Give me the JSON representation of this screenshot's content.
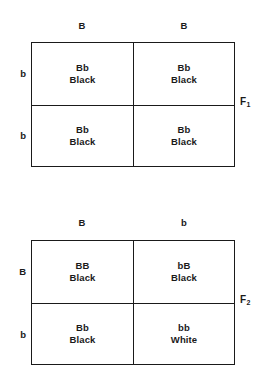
{
  "figure": {
    "ink_color": "#1a1a1a",
    "background_color": "#ffffff"
  },
  "squares": [
    {
      "generation_label": "F",
      "generation_subscript": "1",
      "column_headers": [
        "B",
        "B"
      ],
      "row_headers": [
        "b",
        "b"
      ],
      "cells": [
        {
          "genotype": "Bb",
          "phenotype": "Black"
        },
        {
          "genotype": "Bb",
          "phenotype": "Black"
        },
        {
          "genotype": "Bb",
          "phenotype": "Black"
        },
        {
          "genotype": "Bb",
          "phenotype": "Black"
        }
      ]
    },
    {
      "generation_label": "F",
      "generation_subscript": "2",
      "column_headers": [
        "B",
        "b"
      ],
      "row_headers": [
        "B",
        "b"
      ],
      "cells": [
        {
          "genotype": "BB",
          "phenotype": "Black"
        },
        {
          "genotype": "bB",
          "phenotype": "Black"
        },
        {
          "genotype": "Bb",
          "phenotype": "Black"
        },
        {
          "genotype": "bb",
          "phenotype": "White"
        }
      ]
    }
  ]
}
